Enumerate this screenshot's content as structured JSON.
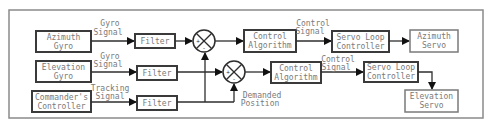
{
  "diagram": {
    "blocks": {
      "azimuth_gyro": [
        "Azimuth",
        "Gyro"
      ],
      "elevation_gyro": [
        "Elevation",
        "Gyro"
      ],
      "commanders_controller": [
        "Commander's",
        "Controller"
      ],
      "filter_1": "Filter",
      "filter_2": "Filter",
      "filter_3": "Filter",
      "control_algorithm_1": [
        "Control",
        "Algorithm"
      ],
      "control_algorithm_2": [
        "Control",
        "Algorithm"
      ],
      "servo_loop_controller_1": [
        "Servo Loop",
        "Controller"
      ],
      "servo_loop_controller_2": [
        "Servo Loop",
        "Controller"
      ],
      "azimuth_servo": [
        "Azimuth",
        "Servo"
      ],
      "elevation_servo": [
        "Elevation",
        "Servo"
      ]
    },
    "signals": {
      "gyro_signal_1": [
        "Gyro",
        "Signal"
      ],
      "gyro_signal_2": [
        "Gyro",
        "Signal"
      ],
      "tracking_signal": [
        "Tracking",
        "Signal"
      ],
      "control_signal_1": [
        "Control",
        "Signal"
      ],
      "control_signal_2": [
        "Control",
        "Signal"
      ],
      "demanded_position": [
        "Demanded",
        "Position"
      ]
    },
    "summing_junctions": {
      "sum_1": {
        "plus": "+",
        "minus": "-"
      },
      "sum_2": {
        "plus": "+",
        "minus": "-"
      }
    }
  }
}
